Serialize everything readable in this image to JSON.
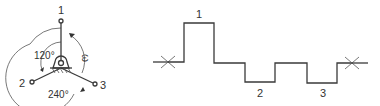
{
  "left_diagram": {
    "description": "Three-arm star with pivot base, 120° spacing",
    "nodes": [
      {
        "label": "1"
      },
      {
        "label": "2"
      },
      {
        "label": "3"
      }
    ],
    "angle_labels": [
      "120°",
      "240°"
    ],
    "rotation_label": "ω"
  },
  "right_diagram": {
    "description": "Stepped waveform with levels for positions 1, 2, 3",
    "step_labels": [
      "1",
      "2",
      "3"
    ]
  }
}
